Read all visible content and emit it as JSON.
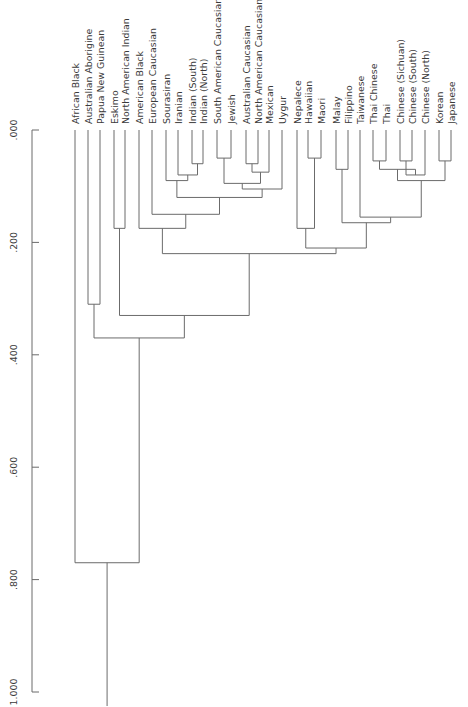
{
  "chart_data": {
    "type": "dendrogram",
    "title": "",
    "orientation": "vertical, leaves at top, root at bottom",
    "axis": {
      "label": "",
      "range": [
        0.0,
        1.0
      ],
      "ticks": [
        ".000",
        ".200",
        ".400",
        ".600",
        ".800",
        "1.000"
      ],
      "tick_values": [
        0.0,
        0.2,
        0.4,
        0.6,
        0.8,
        1.0
      ],
      "grid": false
    },
    "leaves": [
      "African Black",
      "Australian Aborigine",
      "Papua New Guinean",
      "Eskimo",
      "North American Indian",
      "American Black",
      "European Caucasian",
      "Sourasiran",
      "Iranian",
      "Indian (South)",
      "Indian (North)",
      "South American Caucasian",
      "Jewish",
      "Australian Caucasian",
      "North American Caucasian",
      "Mexican",
      "Uygur",
      "Nepalece",
      "Hawaiian",
      "Maori",
      "Malay",
      "Filippino",
      "Taiwanese",
      "Thai Chinese",
      "Thai",
      "Chinese (Sichuan)",
      "Chinese (South)",
      "Chinese (North)",
      "Korean",
      "Japanese"
    ],
    "merges": [
      {
        "id": "m1",
        "left": "Indian (South)",
        "right": "Indian (North)",
        "height": 0.06
      },
      {
        "id": "m2",
        "left": "Australian Caucasian",
        "right": "North American Caucasian",
        "height": 0.06
      },
      {
        "id": "m3",
        "left": "Chinese (Sichuan)",
        "right": "Chinese (South)",
        "height": 0.055
      },
      {
        "id": "m4",
        "left": "Korean",
        "right": "Japanese",
        "height": 0.055
      },
      {
        "id": "m5",
        "left": "Hawaiian",
        "right": "Maori",
        "height": 0.05
      },
      {
        "id": "m6",
        "left": "Thai Chinese",
        "right": "Thai",
        "height": 0.055
      },
      {
        "id": "m7",
        "left": "Iranian",
        "right": "m1",
        "height": 0.08
      },
      {
        "id": "m8",
        "left": "South American Caucasian",
        "right": "Jewish",
        "height": 0.05
      },
      {
        "id": "m9",
        "left": "m2",
        "right": "Mexican",
        "height": 0.075
      },
      {
        "id": "m10",
        "left": "m3",
        "right": "Chinese (North)",
        "height": 0.08
      },
      {
        "id": "m11",
        "left": "Malay",
        "right": "Filippino",
        "height": 0.07
      },
      {
        "id": "m12",
        "left": "Sourasiran",
        "right": "m7",
        "height": 0.09
      },
      {
        "id": "m13",
        "left": "m8",
        "right": "m9",
        "height": 0.095
      },
      {
        "id": "m14",
        "left": "m6",
        "right": "m10",
        "height": 0.07
      },
      {
        "id": "m15",
        "left": "m14",
        "right": "m4",
        "height": 0.09
      },
      {
        "id": "m16",
        "left": "m13",
        "right": "Uygur",
        "height": 0.105
      },
      {
        "id": "m17",
        "left": "m12",
        "right": "m16",
        "height": 0.12
      },
      {
        "id": "m18",
        "left": "European Caucasian",
        "right": "m17",
        "height": 0.15
      },
      {
        "id": "m19",
        "left": "Taiwanese",
        "right": "m15",
        "height": 0.155
      },
      {
        "id": "m20",
        "left": "m11",
        "right": "m19",
        "height": 0.165
      },
      {
        "id": "m21",
        "left": "Nepalece",
        "right": "m5",
        "height": 0.175
      },
      {
        "id": "m22",
        "left": "Eskimo",
        "right": "North American Indian",
        "height": 0.175
      },
      {
        "id": "m23",
        "left": "American Black",
        "right": "m18",
        "height": 0.175
      },
      {
        "id": "m24",
        "left": "m21",
        "right": "m20",
        "height": 0.21
      },
      {
        "id": "m25",
        "left": "m23",
        "right": "m24",
        "height": 0.22
      },
      {
        "id": "m26",
        "left": "Australian Aborigine",
        "right": "Papua New Guinean",
        "height": 0.31
      },
      {
        "id": "m27",
        "left": "m22",
        "right": "m25",
        "height": 0.33
      },
      {
        "id": "m28",
        "left": "m26",
        "right": "m27",
        "height": 0.37
      },
      {
        "id": "m29",
        "left": "African Black",
        "right": "m28",
        "height": 0.77
      }
    ]
  },
  "layout": {
    "axis_x": 32,
    "axis_top_y": 130,
    "axis_bottom_y": 692,
    "leaf_x": [
      75,
      88,
      100,
      114,
      125,
      139,
      152,
      166,
      178,
      192,
      203,
      217,
      231,
      246,
      258,
      269,
      282,
      297,
      308,
      321,
      336,
      348,
      360,
      373,
      386,
      400,
      412,
      425,
      439,
      451
    ],
    "root_bottom_y": 706,
    "line_color": "#6b6b6b",
    "text_color": "#3a3a3a"
  }
}
